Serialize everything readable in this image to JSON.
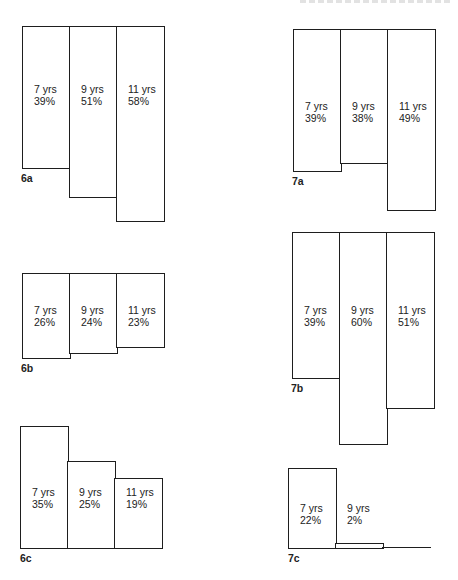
{
  "header": {
    "text": ""
  },
  "chart_data": [
    {
      "id": "6a",
      "type": "bar",
      "label": "6a",
      "categories": [
        "7 yrs",
        "9 yrs",
        "11 yrs"
      ],
      "values": [
        39,
        51,
        58
      ],
      "value_labels": [
        "39%",
        "51%",
        "58%"
      ],
      "title": "",
      "xlabel": "",
      "ylabel": "",
      "layout": {
        "top": 26,
        "left": 22,
        "bar_width": 47,
        "bottoms": [
          167,
          196,
          220
        ],
        "text_y": 83,
        "label_x": 21,
        "label_y": 172
      }
    },
    {
      "id": "7a",
      "type": "bar",
      "label": "7a",
      "categories": [
        "7 yrs",
        "9 yrs",
        "11 yrs"
      ],
      "values": [
        39,
        38,
        49
      ],
      "value_labels": [
        "39%",
        "38%",
        "49%"
      ],
      "title": "",
      "xlabel": "",
      "ylabel": "",
      "layout": {
        "top": 29,
        "left": 293,
        "bar_width": 47,
        "bottoms": [
          170,
          162,
          209
        ],
        "text_y": 100,
        "label_x": 292,
        "label_y": 175
      }
    },
    {
      "id": "6b",
      "type": "bar",
      "label": "6b",
      "categories": [
        "7 yrs",
        "9 yrs",
        "11 yrs"
      ],
      "values": [
        26,
        24,
        23
      ],
      "value_labels": [
        "26%",
        "24%",
        "23%"
      ],
      "title": "",
      "xlabel": "",
      "ylabel": "",
      "layout": {
        "top": 273,
        "left": 22,
        "bar_width": 47,
        "bottoms": [
          357,
          352,
          346
        ],
        "text_y": 304,
        "label_x": 21,
        "label_y": 362
      }
    },
    {
      "id": "7b",
      "type": "bar",
      "label": "7b",
      "categories": [
        "7 yrs",
        "9 yrs",
        "11 yrs"
      ],
      "values": [
        39,
        60,
        51
      ],
      "value_labels": [
        "39%",
        "60%",
        "51%"
      ],
      "title": "",
      "xlabel": "",
      "ylabel": "",
      "layout": {
        "top": 232,
        "left": 292,
        "bar_width": 47,
        "bottoms": [
          377,
          443,
          407
        ],
        "text_y": 304,
        "label_x": 291,
        "label_y": 382
      }
    },
    {
      "id": "6c",
      "type": "bar",
      "label": "6c",
      "categories": [
        "7 yrs",
        "9 yrs",
        "11 yrs"
      ],
      "values": [
        35,
        25,
        19
      ],
      "value_labels": [
        "35%",
        "25%",
        "19%"
      ],
      "title": "",
      "xlabel": "",
      "ylabel": "",
      "layout": {
        "baseline": 547,
        "left": 20,
        "bar_width": 47,
        "tops": [
          426,
          461,
          478
        ],
        "text_y": 486,
        "label_x": 20,
        "label_y": 552
      }
    },
    {
      "id": "7c",
      "type": "bar",
      "label": "7c",
      "categories": [
        "7 yrs",
        "9 yrs",
        "11 yrs"
      ],
      "values": [
        22,
        2,
        0
      ],
      "value_labels": [
        "22%",
        "2%",
        ""
      ],
      "title": "",
      "xlabel": "",
      "ylabel": "",
      "layout": {
        "baseline": 547,
        "left": 288,
        "bar_width": 47,
        "tops": [
          468,
          543,
          547
        ],
        "text_y": 502,
        "label_x": 288,
        "label_y": 552,
        "baseline_end": 431
      }
    }
  ]
}
